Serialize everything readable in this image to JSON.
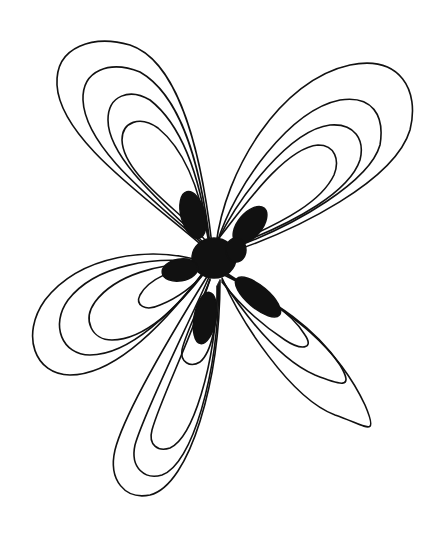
{
  "image": {
    "subject": "hand-drawn ink flower with nested looping petals and solid dark center",
    "background_color": "#ffffff",
    "ink_color": "#111111",
    "center": {
      "x": 213,
      "y": 258
    },
    "petal_groups": [
      {
        "name": "upper-left",
        "loops": 4
      },
      {
        "name": "upper-right",
        "loops": 4
      },
      {
        "name": "left",
        "loops": 4
      },
      {
        "name": "bottom",
        "loops": 4
      },
      {
        "name": "lower-right",
        "loops": 3
      }
    ],
    "inner_solid_petals": 6
  }
}
